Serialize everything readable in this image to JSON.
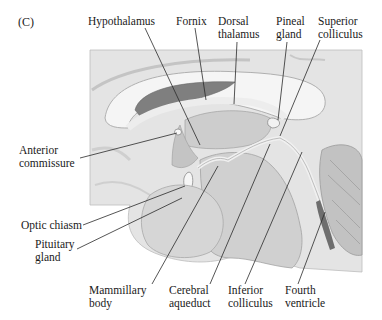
{
  "figure": {
    "panel_label": "(C)"
  },
  "labels": {
    "top": [
      {
        "id": "hypothalamus",
        "lines": [
          "Hypothalamus"
        ]
      },
      {
        "id": "fornix",
        "lines": [
          "Fornix"
        ]
      },
      {
        "id": "dorsal-thalamus",
        "lines": [
          "Dorsal",
          "thalamus"
        ]
      },
      {
        "id": "pineal-gland",
        "lines": [
          "Pineal",
          "gland"
        ]
      },
      {
        "id": "superior-colliculus",
        "lines": [
          "Superior",
          "colliculus"
        ]
      }
    ],
    "left": [
      {
        "id": "anterior-commissure",
        "lines": [
          "Anterior",
          "commissure"
        ]
      },
      {
        "id": "optic-chiasm",
        "lines": [
          "Optic chiasm"
        ]
      },
      {
        "id": "pituitary-gland",
        "lines": [
          "Pituitary",
          "gland"
        ]
      }
    ],
    "bottom": [
      {
        "id": "mammillary-body",
        "lines": [
          "Mammillary",
          "body"
        ]
      },
      {
        "id": "cerebral-aqueduct",
        "lines": [
          "Cerebral",
          "aqueduct"
        ]
      },
      {
        "id": "inferior-colliculus",
        "lines": [
          "Inferior",
          "colliculus"
        ]
      },
      {
        "id": "fourth-ventricle",
        "lines": [
          "Fourth",
          "ventricle"
        ]
      }
    ]
  },
  "colors": {
    "background": "#ffffff",
    "tissue_light": "#e6e6e6",
    "tissue_mid": "#c8c8c8",
    "tissue_dark": "#8e8e8e",
    "corpus_callosum": "#f4f4f4",
    "ventricle": "#7a7a7a",
    "leader_line": "#2a2a2a"
  }
}
